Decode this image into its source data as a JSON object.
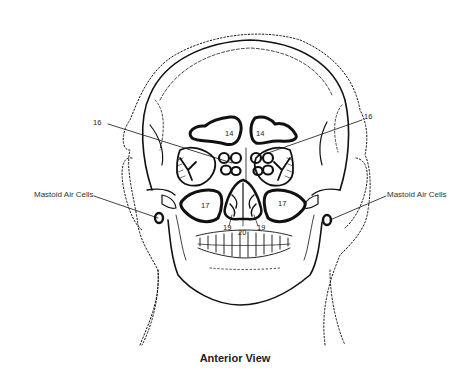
{
  "title": "Anterior View",
  "labels": {
    "mastoid_left": "Mastoid Air Cells",
    "mastoid_right": "Mastoid Air Cells",
    "num_16_left": "16",
    "num_16_right": "16",
    "num_14_left": "14",
    "num_14_right": "14",
    "num_17_left": "17",
    "num_17_right": "17",
    "num_19_left": "19",
    "num_19_right": "19",
    "num_20": "20"
  },
  "colors": {
    "stroke": "#111111",
    "background": "#ffffff"
  }
}
